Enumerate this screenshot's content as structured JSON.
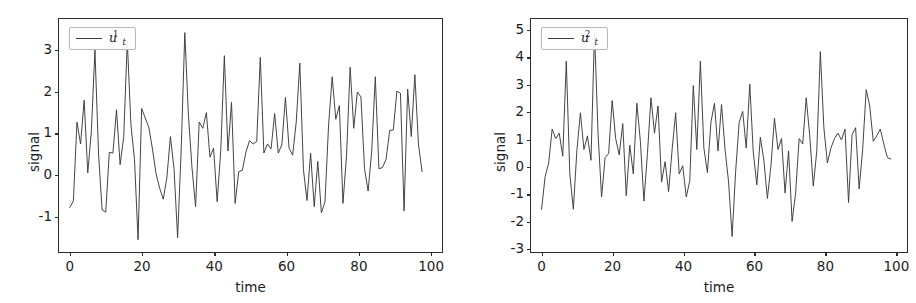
{
  "figure": {
    "background": "#ffffff",
    "line_color": "#3a3a3a",
    "axis_color": "#2b2b2b"
  },
  "chart_data": [
    {
      "type": "line",
      "panel": "left",
      "title": "",
      "xlabel": "time",
      "ylabel": "signal",
      "legend": [
        {
          "name": "u_t^1",
          "base": "u",
          "sub": "t",
          "sup": "1"
        }
      ],
      "legend_position": "upper left",
      "grid": false,
      "xlim": [
        -3,
        103
      ],
      "ylim": [
        -1.85,
        3.75
      ],
      "xticks": [
        0,
        20,
        40,
        60,
        80,
        100
      ],
      "xticklabels": [
        "0",
        "20",
        "40",
        "60",
        "80",
        "100"
      ],
      "yticks": [
        -1,
        0,
        1,
        2,
        3
      ],
      "yticklabels": [
        "-1",
        "0",
        "1",
        "2",
        "3"
      ],
      "series": [
        {
          "name": "u_t^1",
          "x": [
            0,
            1,
            2,
            3,
            4,
            5,
            6,
            7,
            8,
            9,
            10,
            11,
            12,
            13,
            14,
            15,
            16,
            17,
            18,
            19,
            20,
            21,
            22,
            23,
            24,
            25,
            26,
            27,
            28,
            29,
            30,
            31,
            32,
            33,
            34,
            35,
            36,
            37,
            38,
            39,
            40,
            41,
            42,
            43,
            44,
            45,
            46,
            47,
            48,
            49,
            50,
            51,
            52,
            53,
            54,
            55,
            56,
            57,
            58,
            59,
            60,
            61,
            62,
            63,
            64,
            65,
            66,
            67,
            68,
            69,
            70,
            71,
            72,
            73,
            74,
            75,
            76,
            77,
            78,
            79,
            80,
            81,
            82,
            83,
            84,
            85,
            86,
            87,
            88,
            89,
            90,
            91,
            92,
            93,
            94,
            95,
            96,
            97,
            98,
            99
          ],
          "values": [
            -0.82,
            -0.66,
            1.25,
            0.72,
            1.78,
            0.02,
            1.02,
            3.0,
            0.48,
            -0.88,
            -0.93,
            0.52,
            0.5,
            1.55,
            0.22,
            0.88,
            3.22,
            1.2,
            0.34,
            -1.6,
            1.58,
            1.35,
            1.12,
            0.6,
            0.0,
            -0.35,
            -0.62,
            -0.1,
            0.9,
            0.12,
            -1.55,
            0.6,
            3.42,
            1.42,
            0.15,
            -0.8,
            1.25,
            1.1,
            1.48,
            0.4,
            0.62,
            -0.68,
            0.55,
            2.86,
            0.55,
            1.73,
            -0.72,
            0.05,
            0.08,
            0.52,
            0.8,
            0.72,
            0.78,
            2.82,
            0.5,
            0.72,
            0.6,
            1.46,
            0.5,
            0.7,
            1.85,
            0.62,
            0.45,
            1.25,
            2.68,
            0.1,
            -0.65,
            0.5,
            -0.8,
            0.3,
            -0.95,
            -0.68,
            1.18,
            2.35,
            1.32,
            1.65,
            -0.72,
            0.45,
            2.58,
            1.1,
            1.98,
            1.86,
            0.12,
            -0.42,
            0.55,
            2.35,
            0.12,
            0.15,
            0.35,
            1.05,
            1.06,
            2.0,
            1.95,
            -0.9,
            2.05,
            0.9,
            2.4,
            0.72,
            0.05
          ]
        }
      ]
    },
    {
      "type": "line",
      "panel": "right",
      "title": "",
      "xlabel": "time",
      "ylabel": "signal",
      "legend": [
        {
          "name": "u_t^2",
          "base": "u",
          "sub": "t",
          "sup": "2"
        }
      ],
      "legend_position": "upper left",
      "grid": false,
      "xlim": [
        -3,
        103
      ],
      "ylim": [
        -3.1,
        5.4
      ],
      "xticks": [
        0,
        20,
        40,
        60,
        80,
        100
      ],
      "xticklabels": [
        "0",
        "20",
        "40",
        "60",
        "80",
        "100"
      ],
      "yticks": [
        -3,
        -2,
        -1,
        0,
        1,
        2,
        3,
        4,
        5
      ],
      "yticklabels": [
        "-3",
        "-2",
        "-1",
        "0",
        "1",
        "2",
        "3",
        "4",
        "5"
      ],
      "series": [
        {
          "name": "u_t^2",
          "x": [
            0,
            1,
            2,
            3,
            4,
            5,
            6,
            7,
            8,
            9,
            10,
            11,
            12,
            13,
            14,
            15,
            16,
            17,
            18,
            19,
            20,
            21,
            22,
            23,
            24,
            25,
            26,
            27,
            28,
            29,
            30,
            31,
            32,
            33,
            34,
            35,
            36,
            37,
            38,
            39,
            40,
            41,
            42,
            43,
            44,
            45,
            46,
            47,
            48,
            49,
            50,
            51,
            52,
            53,
            54,
            55,
            56,
            57,
            58,
            59,
            60,
            61,
            62,
            63,
            64,
            65,
            66,
            67,
            68,
            69,
            70,
            71,
            72,
            73,
            74,
            75,
            76,
            77,
            78,
            79,
            80,
            81,
            82,
            83,
            84,
            85,
            86,
            87,
            88,
            89,
            90,
            91,
            92,
            93,
            94,
            95,
            96,
            97,
            98,
            99
          ],
          "values": [
            -1.6,
            -0.4,
            0.1,
            1.35,
            1.0,
            1.2,
            0.35,
            3.85,
            -0.3,
            -1.6,
            0.55,
            1.95,
            0.6,
            1.1,
            0.2,
            4.95,
            1.2,
            -1.15,
            0.3,
            0.45,
            2.4,
            1.0,
            0.4,
            1.55,
            -1.1,
            0.75,
            -0.3,
            2.3,
            0.9,
            -1.3,
            0.45,
            2.5,
            1.2,
            2.2,
            -0.6,
            0.15,
            -0.95,
            0.6,
            1.95,
            -0.3,
            0.0,
            -1.15,
            -0.55,
            2.95,
            0.6,
            3.85,
            0.65,
            -0.25,
            1.6,
            2.3,
            0.55,
            2.25,
            0.6,
            -0.6,
            -2.6,
            -0.2,
            1.6,
            2.0,
            0.65,
            3.0,
            0.5,
            -0.7,
            1.05,
            0.2,
            -1.2,
            0.0,
            1.75,
            0.6,
            1.0,
            -1.0,
            0.55,
            -2.05,
            -1.0,
            1.0,
            0.8,
            2.5,
            1.1,
            -0.75,
            0.55,
            4.2,
            1.4,
            0.1,
            0.65,
            1.0,
            1.2,
            0.95,
            1.35,
            -1.35,
            1.15,
            1.4,
            -0.85,
            0.6,
            2.8,
            2.2,
            0.9,
            1.1,
            1.35,
            0.8,
            0.3,
            0.25
          ]
        }
      ]
    }
  ]
}
